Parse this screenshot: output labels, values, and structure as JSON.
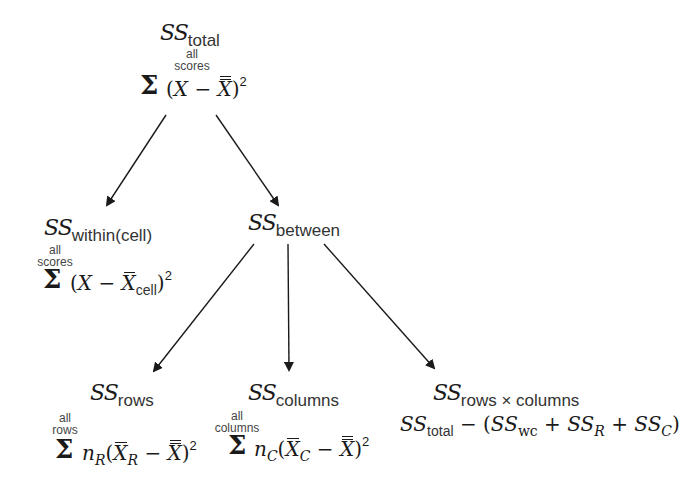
{
  "diagram": {
    "type": "tree",
    "nodes": {
      "total": {
        "label_main": "SS",
        "label_sub": "total",
        "limit_top": "all",
        "limit_bottom": "scores",
        "sigma": "Σ",
        "formula": "(X − X̿)²"
      },
      "within": {
        "label_main": "SS",
        "label_sub": "within(cell)",
        "limit_top": "all",
        "limit_bottom": "scores",
        "sigma": "Σ",
        "formula": "(X − X̄cell)²"
      },
      "between": {
        "label_main": "SS",
        "label_sub": "between"
      },
      "rows": {
        "label_main": "SS",
        "label_sub": "rows",
        "limit_top": "all",
        "limit_bottom": "rows",
        "sigma": "Σ",
        "formula": "nR(X̄R − X̿)²"
      },
      "columns": {
        "label_main": "SS",
        "label_sub": "columns",
        "limit_top": "all",
        "limit_bottom": "columns",
        "sigma": "Σ",
        "formula": "nC(X̄C − X̿)²"
      },
      "interaction": {
        "label_main": "SS",
        "label_sub": "rows × columns",
        "formula": "SStotal − (SSwc + SSR + SSC)"
      }
    },
    "edges": [
      {
        "from": "total",
        "to": "within"
      },
      {
        "from": "total",
        "to": "between"
      },
      {
        "from": "between",
        "to": "rows"
      },
      {
        "from": "between",
        "to": "columns"
      },
      {
        "from": "between",
        "to": "interaction"
      }
    ],
    "symbols": {
      "X": "X",
      "n": "n",
      "R": "R",
      "C": "C",
      "open": "(",
      "close": ")",
      "minus": " − ",
      "plus": " + ",
      "sq": "2",
      "cell": "cell",
      "wc": "wc",
      "total": "total",
      "SS": "SS"
    },
    "colors": {
      "ink": "#1a1a1a",
      "background": "#ffffff"
    }
  }
}
